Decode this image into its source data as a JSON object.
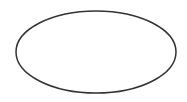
{
  "canvas": {
    "width": 187,
    "height": 102,
    "background": "#ffffff"
  },
  "shapes": [
    {
      "type": "ellipse",
      "cx": 96,
      "cy": 52,
      "rx": 80,
      "ry": 41,
      "stroke": "#333333",
      "stroke_width": 1.5,
      "fill": "none"
    }
  ]
}
